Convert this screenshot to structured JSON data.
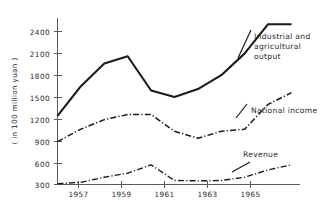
{
  "chart_data": {
    "type": "line",
    "title": "",
    "xlabel": "",
    "ylabel": "( in 100 million yuan )",
    "ylim": [
      300,
      2550
    ],
    "xlim": [
      1956.5,
      1966.5
    ],
    "grid": false,
    "legend_position": "inline-annotations",
    "y_ticks": [
      300,
      600,
      900,
      1200,
      1500,
      1800,
      2100,
      2400
    ],
    "y_tick_labels": [
      "300",
      "600",
      "900",
      "1200",
      "1500",
      "1800",
      "2100",
      "2400"
    ],
    "x_ticks": [
      1957,
      1959,
      1961,
      1963,
      1965
    ],
    "x_tick_labels": [
      "1957",
      "1959",
      "1961",
      "1963",
      "1965"
    ],
    "x": [
      1957,
      1958,
      1959,
      1960,
      1961,
      1962,
      1963,
      1964,
      1965,
      1966
    ],
    "series": [
      {
        "name": "Industrial and agricultural output",
        "style": "solid",
        "color": "#1a1a1a",
        "values": [
          1241,
          1650,
          1960,
          2060,
          1590,
          1500,
          1610,
          1800,
          2100,
          2500
        ]
      },
      {
        "name": "National income",
        "style": "dash-dot",
        "color": "#1a1a1a",
        "values": [
          888,
          1060,
          1190,
          1260,
          1260,
          1030,
          935,
          1030,
          1060,
          1230
        ]
      },
      {
        "name": "Revenue",
        "style": "dash-dot",
        "color": "#1a1a1a",
        "values": [
          310,
          330,
          400,
          455,
          570,
          355,
          350,
          355,
          400,
          455
        ]
      }
    ],
    "series_extra": {
      "national_income_tail_x": [
        1966,
        1967
      ],
      "national_income_tail_y": [
        1400,
        1560
      ],
      "revenue_tail_x": [
        1966,
        1967
      ],
      "revenue_tail_y": [
        500,
        570
      ],
      "output_tail_x": [
        1967
      ],
      "output_tail_y": [
        2500
      ]
    },
    "annotations": [
      {
        "id": "annot-industrial",
        "lines": [
          "Industrial and",
          "agricultural",
          "output"
        ],
        "x": 254,
        "y": 39
      },
      {
        "id": "annot-national-income",
        "lines": [
          "National income"
        ],
        "x": 251,
        "y": 113
      },
      {
        "id": "annot-revenue",
        "lines": [
          "Revenue"
        ],
        "x": 243,
        "y": 157
      }
    ]
  },
  "axis": {
    "y_title": "( in 100 million yuan )",
    "y_labels": {
      "t2400": "2400",
      "t2100": "2100",
      "t1800": "1800",
      "t1500": "1500",
      "t1200": "1200",
      "t900": "900",
      "t600": "600",
      "t300": "300"
    },
    "x_labels": {
      "y1957": "1957",
      "y1959": "1959",
      "y1961": "1961",
      "y1963": "1963",
      "y1965": "1965"
    }
  },
  "annotations": {
    "industrial_l1": "Industrial and",
    "industrial_l2": "agricultural",
    "industrial_l3": "output",
    "national_income": "National income",
    "revenue": "Revenue"
  },
  "colors": {
    "ink": "#1a1a1a",
    "axis": "#5a5a5a",
    "background": "#ffffff"
  }
}
